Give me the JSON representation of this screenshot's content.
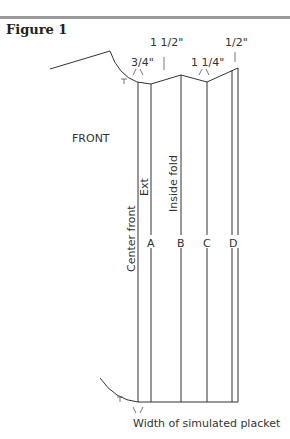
{
  "figure": {
    "title": "Figure 1"
  },
  "measurements": {
    "m1": "3/4\"",
    "m2": "1 1/2\"",
    "m3": "1 1/4\"",
    "m4": "1/2\""
  },
  "labels": {
    "front": "FRONT",
    "center_front": "Center front",
    "ext": "Ext",
    "inside_fold": "Inside fold",
    "a": "A",
    "b": "B",
    "c": "C",
    "d": "D",
    "bottom": "Width of simulated placket"
  },
  "colors": {
    "line": "#333333",
    "rule": "#9a9a9a"
  }
}
